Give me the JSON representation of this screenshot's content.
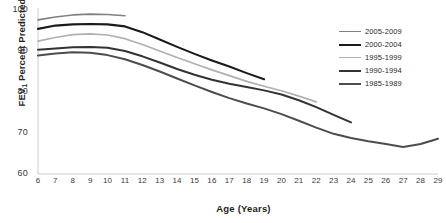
{
  "chart_data": {
    "type": "line",
    "title": "",
    "xlabel": "Age (Years)",
    "ylabel": "FEV1 Percent Predicted",
    "ylabel_base": "FEV",
    "ylabel_sub": "1",
    "ylabel_rest": " Percent Predicted",
    "grid": false,
    "legend_position": "top-right",
    "xlim": [
      6,
      29
    ],
    "ylim": [
      60,
      100
    ],
    "yticks": [
      100,
      90,
      80,
      70,
      60
    ],
    "xticks": [
      6,
      7,
      8,
      9,
      10,
      11,
      12,
      13,
      14,
      15,
      16,
      17,
      18,
      19,
      20,
      21,
      22,
      23,
      24,
      25,
      26,
      27,
      28,
      29
    ],
    "series": [
      {
        "name": "2005-2009",
        "color": "#808080",
        "width": 1.6,
        "x": [
          6,
          7,
          8,
          9,
          10,
          11
        ],
        "values": [
          97.6,
          98.3,
          98.8,
          99.0,
          98.9,
          98.6
        ]
      },
      {
        "name": "2000-2004",
        "color": "#1a1a1a",
        "width": 2.1,
        "x": [
          6,
          7,
          8,
          9,
          10,
          11,
          12,
          13,
          14,
          15,
          16,
          17,
          18,
          19
        ],
        "values": [
          95.4,
          96.2,
          96.5,
          96.6,
          96.5,
          96.0,
          94.6,
          92.8,
          91.0,
          89.3,
          87.7,
          86.2,
          84.6,
          83.1
        ]
      },
      {
        "name": "1995-1999",
        "color": "#b0b0b0",
        "width": 1.7,
        "x": [
          6,
          7,
          8,
          9,
          10,
          11,
          12,
          13,
          14,
          15,
          16,
          17,
          18,
          19,
          20,
          21,
          22
        ],
        "values": [
          92.4,
          93.3,
          94.0,
          94.2,
          93.9,
          93.0,
          91.6,
          90.0,
          88.4,
          86.9,
          85.4,
          84.0,
          82.6,
          81.4,
          80.3,
          79.0,
          77.6
        ]
      },
      {
        "name": "1990-1994",
        "color": "#333333",
        "width": 2.0,
        "x": [
          6,
          7,
          8,
          9,
          10,
          11,
          12,
          13,
          14,
          15,
          16,
          17,
          18,
          19,
          20,
          21,
          22,
          23,
          24
        ],
        "values": [
          90.3,
          90.6,
          90.9,
          91.0,
          90.8,
          90.0,
          88.7,
          87.2,
          85.6,
          84.2,
          83.0,
          82.0,
          81.2,
          80.4,
          79.4,
          78.0,
          76.3,
          74.4,
          72.6
        ]
      },
      {
        "name": "1985-1989",
        "color": "#4d4d4d",
        "width": 2.0,
        "x": [
          6,
          7,
          8,
          9,
          10,
          11,
          12,
          13,
          14,
          15,
          16,
          17,
          18,
          19,
          20,
          21,
          22,
          23,
          24,
          25,
          26,
          27,
          28,
          29
        ],
        "values": [
          88.9,
          89.4,
          89.7,
          89.6,
          89.0,
          88.0,
          86.6,
          85.0,
          83.3,
          81.6,
          80.0,
          78.5,
          77.2,
          76.0,
          74.6,
          73.0,
          71.3,
          69.8,
          68.8,
          68.0,
          67.3,
          66.6,
          67.3,
          68.6
        ]
      }
    ]
  },
  "legend": {
    "items": [
      {
        "label": "2005-2009"
      },
      {
        "label": "2000-2004"
      },
      {
        "label": "1995-1999"
      },
      {
        "label": "1990-1994"
      },
      {
        "label": "1985-1989"
      }
    ]
  }
}
